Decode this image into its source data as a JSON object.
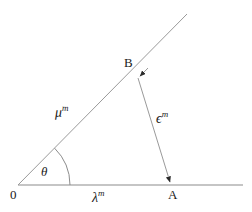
{
  "figure": {
    "type": "geometry-diagram",
    "background_color": "#ffffff",
    "line_color": "#8c8c8c",
    "text_color": "#1a1a1a",
    "width": 252,
    "height": 212
  },
  "points": {
    "origin": {
      "label": "0",
      "x": 18,
      "y": 185
    },
    "b": {
      "label": "B",
      "x": 138,
      "y": 78
    },
    "a": {
      "label": "A",
      "x": 172,
      "y": 185
    }
  },
  "labels": {
    "mu": {
      "base": "μ",
      "sup": "m"
    },
    "epsilon": {
      "base": "ϵ",
      "sup": "m"
    },
    "lambda": {
      "base": "λ",
      "sup": "m"
    },
    "theta": {
      "base": "θ"
    }
  },
  "edges": {
    "axis": {
      "name": "horizontal-axis",
      "x1": 18,
      "y1": 185,
      "x2": 243,
      "y2": 185
    },
    "ray": {
      "name": "inclined-ray",
      "x1": 18,
      "y1": 185,
      "x2": 187,
      "y2": 14
    },
    "segment_ba": {
      "name": "segment-b-to-a",
      "x1": 138,
      "y1": 78,
      "x2": 172,
      "y2": 185
    }
  },
  "angle_arc": {
    "name": "theta-arc",
    "center_x": 18,
    "center_y": 185,
    "radius": 52,
    "start_deg": 0,
    "end_deg": 45
  }
}
